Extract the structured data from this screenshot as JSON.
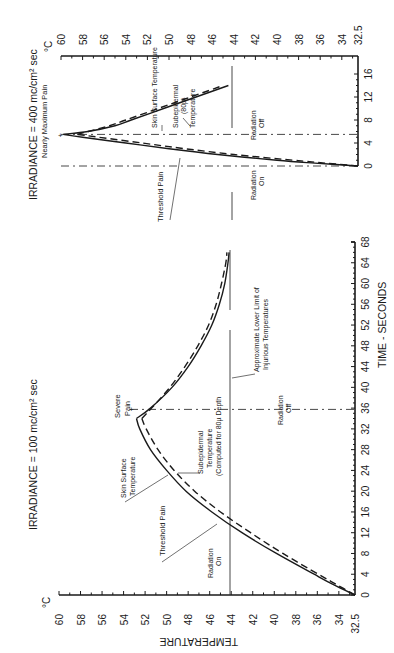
{
  "figure": {
    "y_axis_label": "TEMPERATURE",
    "unit_label": "°C",
    "x_axis_label": "TIME - SECONDS"
  },
  "panels": {
    "upper": {
      "title": "IRRADIANCE = 400 mc/cm² sec",
      "temp_ticks": [
        "60",
        "58",
        "56",
        "54",
        "52",
        "50",
        "48",
        "46",
        "44",
        "42",
        "40",
        "38",
        "36",
        "34",
        "32.5"
      ],
      "time_ticks": [
        "0",
        "4",
        "8",
        "12",
        "16"
      ],
      "labels": {
        "peak": "Nearly Maximum Pain",
        "skin": "Skin Surface Temperature",
        "sub_1": "Subepidermal",
        "sub_2": "(80µ)",
        "sub_3": "Temperature",
        "threshold": "Threshold Pain",
        "rad_on_1": "Radiation",
        "rad_on_2": "On",
        "rad_off_1": "Radiation",
        "rad_off_2": "Off"
      }
    },
    "lower": {
      "title": "IRRADIANCE = 100 mc/cm² sec",
      "temp_ticks": [
        "60",
        "58",
        "56",
        "54",
        "52",
        "50",
        "48",
        "46",
        "44",
        "42",
        "40",
        "38",
        "36",
        "34",
        "32.5"
      ],
      "time_ticks": [
        "0",
        "4",
        "8",
        "12",
        "16",
        "20",
        "24",
        "28",
        "32",
        "36",
        "40",
        "44",
        "48",
        "52",
        "56",
        "60",
        "64",
        "68"
      ],
      "labels": {
        "peak_1": "Severe",
        "peak_2": "Pain",
        "skin_1": "Skin Surface",
        "skin_2": "Temperature",
        "sub_1": "Subepidermal",
        "sub_2": "Temperature",
        "sub_3": "(Computed for 80µ Depth",
        "threshold": "Threshold Pain",
        "limit_1": "Approximate Lower Limit of",
        "limit_2": "Injurious Temperatures",
        "rad_on_1": "Radiation",
        "rad_on_2": "On",
        "rad_off_1": "Radiation",
        "rad_off_2": "Off"
      }
    }
  },
  "chart_data": [
    {
      "type": "line",
      "title": "IRRADIANCE = 400 mc/cm² sec",
      "xlabel": "TIME - SECONDS",
      "ylabel": "TEMPERATURE (°C)",
      "xlim": [
        0,
        16
      ],
      "ylim": [
        32.5,
        60
      ],
      "grid": false,
      "annotations": [
        "Nearly Maximum Pain",
        "Threshold Pain",
        "Radiation On (t=0)",
        "Radiation Off (t≈5.5)",
        "44°C injurious limit"
      ],
      "series": [
        {
          "name": "Skin Surface Temperature",
          "style": "solid",
          "x": [
            0,
            0.5,
            1,
            2,
            3,
            4,
            5,
            5.5,
            6,
            7,
            8,
            10,
            12,
            14
          ],
          "y": [
            32.5,
            36.5,
            40,
            45.5,
            50,
            54,
            58,
            59.8,
            57.5,
            55,
            53.5,
            50.5,
            47.5,
            44.5
          ]
        },
        {
          "name": "Subepidermal (80µ) Temperature",
          "style": "dashed",
          "x": [
            0,
            0.5,
            1,
            2,
            3,
            4,
            5,
            5.5,
            6,
            7,
            8,
            10,
            12,
            14
          ],
          "y": [
            32.5,
            35.5,
            38.5,
            44,
            48.5,
            52.5,
            56.5,
            58.5,
            57.5,
            55.5,
            54,
            51,
            48,
            45
          ]
        }
      ]
    },
    {
      "type": "line",
      "title": "IRRADIANCE = 100 mc/cm² sec",
      "xlabel": "TIME - SECONDS",
      "ylabel": "TEMPERATURE (°C)",
      "xlim": [
        0,
        68
      ],
      "ylim": [
        32.5,
        60
      ],
      "grid": false,
      "annotations": [
        "Severe Pain",
        "Threshold Pain",
        "Radiation On (t=0)",
        "Radiation Off (t≈34)",
        "Approximate Lower Limit of Injurious Temperatures (44°C)"
      ],
      "series": [
        {
          "name": "Skin Surface Temperature",
          "style": "solid",
          "x": [
            0,
            2,
            4,
            8,
            12,
            16,
            20,
            24,
            28,
            32,
            34,
            36,
            40,
            44,
            48,
            52,
            56,
            60,
            64,
            66
          ],
          "y": [
            32.5,
            34.5,
            36.3,
            39.8,
            43,
            45.8,
            48.2,
            50,
            51.5,
            52.5,
            52.8,
            51.5,
            49.5,
            48,
            46.8,
            45.8,
            45.1,
            44.6,
            44.3,
            44.2
          ]
        },
        {
          "name": "Subepidermal Temperature (Computed for 80µ Depth)",
          "style": "dashed",
          "x": [
            0,
            2,
            4,
            8,
            12,
            16,
            20,
            24,
            28,
            32,
            34,
            36,
            40,
            44,
            48,
            52,
            56,
            60,
            64,
            66
          ],
          "y": [
            32.5,
            34.2,
            35.9,
            39.2,
            42.2,
            45,
            47.4,
            49.3,
            50.8,
            51.9,
            52.3,
            51.4,
            49.7,
            48.3,
            47.1,
            46.1,
            45.4,
            44.9,
            44.5,
            44.4
          ]
        }
      ]
    }
  ]
}
